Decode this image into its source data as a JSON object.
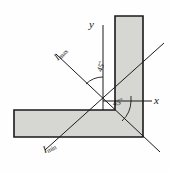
{
  "figure": {
    "kind": "engineering-diagram",
    "axes": {
      "y_label": "y",
      "x_label": "x"
    },
    "principal_axes": {
      "max_symbol": "I",
      "max_subscript": "max",
      "min_symbol": "I",
      "min_subscript": "min"
    },
    "angles": [
      {
        "id": "angle-top",
        "value": "45",
        "degree_mark": "°"
      },
      {
        "id": "angle-bottom",
        "value": "45",
        "degree_mark": "°"
      }
    ],
    "colors": {
      "section_fill": "#d6d6d2",
      "outline": "#1a1a1a",
      "axis": "#1a1a1a",
      "background": "#fefefe"
    }
  }
}
